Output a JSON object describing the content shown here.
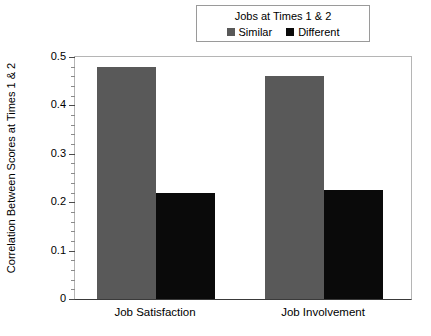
{
  "chart_data": {
    "type": "bar",
    "title": "",
    "xlabel": "",
    "ylabel": "Correlation Between Scores at Times 1 & 2",
    "categories": [
      "Job Satisfaction",
      "Job Involvement"
    ],
    "series": [
      {
        "name": "Similar",
        "color": "#595959",
        "values": [
          0.48,
          0.46
        ]
      },
      {
        "name": "Different",
        "color": "#0a0a0a",
        "values": [
          0.22,
          0.225
        ]
      }
    ],
    "ylim": [
      0,
      0.5
    ],
    "ytick_labels": [
      "0",
      "0.1",
      "0.2",
      "0.3",
      "0.4",
      "0.5"
    ],
    "ytick_values": [
      0,
      0.1,
      0.2,
      0.3,
      0.4,
      0.5
    ],
    "yminor_step": 0.02,
    "grid": false,
    "legend": {
      "position": "top-center",
      "title": "Jobs at Times 1 & 2",
      "entries": [
        {
          "label": "Similar",
          "swatch": "gray-square",
          "color": "#595959"
        },
        {
          "label": "Different",
          "swatch": "black-square",
          "color": "#0a0a0a"
        }
      ]
    }
  },
  "legend": {
    "title": "Jobs at Times 1 & 2",
    "entries": [
      {
        "label": "Similar"
      },
      {
        "label": "Different"
      }
    ]
  },
  "axes": {
    "ylabel": "Correlation Between Scores at Times 1 & 2",
    "yticks": [
      "0.5",
      "0.4",
      "0.3",
      "0.2",
      "0.1",
      "0"
    ],
    "xticks": [
      "Job Satisfaction",
      "Job Involvement"
    ]
  }
}
